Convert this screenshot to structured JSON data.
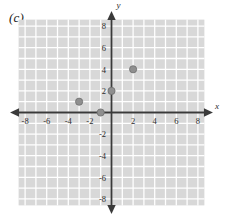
{
  "figure": {
    "panel_label": "(c)",
    "x_axis_name": "x",
    "y_axis_name": "y"
  },
  "colors": {
    "grid_fill": "#d8d8d8",
    "grid_line": "#ffffff",
    "axis": "#3a3a3a",
    "point": "#8f8f8f",
    "point_stroke": "#6e6e6e",
    "text": "#2b2b2b",
    "background": "#ffffff"
  },
  "chart_data": {
    "type": "scatter",
    "title": "(c)",
    "xlabel": "x",
    "ylabel": "y",
    "xlim": [
      -9,
      9
    ],
    "ylim": [
      -9,
      9
    ],
    "grid": true,
    "grid_step": 1,
    "legend": "none",
    "xticks": [
      -8,
      -6,
      -4,
      -2,
      2,
      4,
      6,
      8
    ],
    "yticks": [
      8,
      6,
      4,
      2,
      -2,
      -4,
      -6,
      -8
    ],
    "xtick_labels": [
      "-8",
      "-6",
      "-4",
      "-2",
      "2",
      "4",
      "6",
      "8"
    ],
    "ytick_labels": [
      "8",
      "6",
      "4",
      "2",
      "-2",
      "-4",
      "-6",
      "-8"
    ],
    "points": [
      {
        "x": -1,
        "y": 0
      },
      {
        "x": 0,
        "y": 2
      },
      {
        "x": -3,
        "y": 1
      },
      {
        "x": 2,
        "y": 4
      }
    ],
    "point_radius": 3.6,
    "grid_extent": {
      "xmin": -8.6,
      "xmax": 8.6,
      "ymin": -8.6,
      "ymax": 8.6
    }
  }
}
